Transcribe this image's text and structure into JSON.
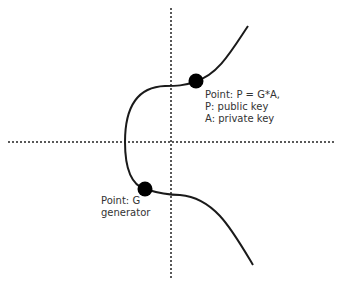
{
  "diagram": {
    "colors": {
      "curve": "#1a1a1a",
      "axis": "#222222",
      "point": "#000000",
      "text": "#333333",
      "background": "#ffffff"
    },
    "points": [
      {
        "id": "P",
        "lines": [
          "Point: P = G*A,",
          "P: public key",
          "A: private key"
        ]
      },
      {
        "id": "G",
        "lines": [
          "Point: G",
          "generator"
        ]
      }
    ]
  }
}
